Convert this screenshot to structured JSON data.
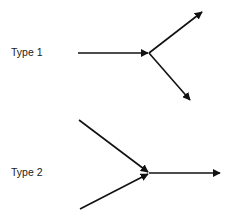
{
  "diagram": {
    "types": [
      {
        "label": "Type 1",
        "description": "one incoming arrow splits into two outgoing arrows",
        "junction": [
          149,
          53
        ],
        "incoming": [
          {
            "from": [
              78,
              53
            ]
          }
        ],
        "outgoing": [
          {
            "to": [
              202,
              12
            ]
          },
          {
            "to": [
              190,
              100
            ]
          }
        ]
      },
      {
        "label": "Type 2",
        "description": "two incoming arrows merge into one outgoing arrow",
        "junction": [
          149,
          173
        ],
        "incoming": [
          {
            "from": [
              79,
              120
            ]
          },
          {
            "from": [
              80,
              209
            ]
          }
        ],
        "outgoing": [
          {
            "to": [
              220,
              173
            ]
          }
        ]
      }
    ],
    "colors": {
      "stroke": "#111111",
      "text": "#222222",
      "background": "#ffffff"
    }
  }
}
